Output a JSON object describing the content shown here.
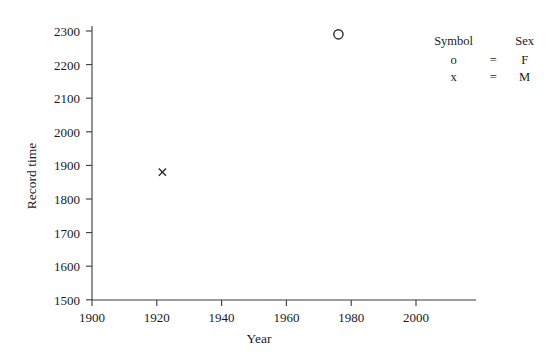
{
  "chart_data": {
    "type": "scatter",
    "title": "",
    "xlabel": "Year",
    "ylabel": "Record time",
    "xlim": [
      1890,
      2010
    ],
    "ylim": [
      1500,
      2320
    ],
    "xticks": [
      1900,
      1920,
      1940,
      1960,
      1980,
      2000
    ],
    "yticks": [
      1500,
      1600,
      1700,
      1800,
      1900,
      2000,
      2100,
      2200,
      2300
    ],
    "xtick_labels": [
      "1900",
      "1920",
      "1940",
      "1960",
      "1980",
      "2000"
    ],
    "ytick_labels": [
      "1500",
      "1600",
      "1700",
      "1800",
      "1900",
      "2000",
      "2100",
      "2200",
      "2300"
    ],
    "grid": false,
    "legend_position": "top-right",
    "series": [
      {
        "name": "F",
        "marker": "o",
        "points": [
          {
            "x": 1967,
            "y": 2290
          }
        ]
      },
      {
        "name": "M",
        "marker": "x",
        "points": [
          {
            "x": 1912,
            "y": 1880
          }
        ]
      }
    ]
  },
  "legend": {
    "header_symbol": "Symbol",
    "header_sex": "Sex",
    "rows": [
      {
        "symbol": "o",
        "equals": "=",
        "sex": "F"
      },
      {
        "symbol": "x",
        "equals": "=",
        "sex": "M"
      }
    ]
  },
  "axes": {
    "x_title": "Year",
    "y_title": "Record time"
  },
  "colors": {
    "axis": "#3a3a3a",
    "text": "#1a1a1a",
    "marker": "#2b2b2b",
    "background": "#ffffff"
  }
}
